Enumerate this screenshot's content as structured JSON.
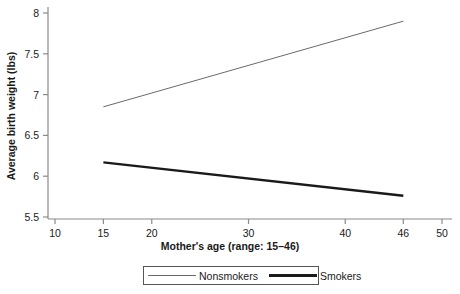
{
  "chart_data": {
    "type": "line",
    "title": "",
    "xlabel": "Mother's age (range: 15–46)",
    "ylabel": "Average birth weight (lbs)",
    "xlim": [
      10,
      50
    ],
    "ylim": [
      5.5,
      8.0
    ],
    "grid": false,
    "legend_position": "bottom",
    "xticks": [
      10,
      15,
      20,
      30,
      40,
      46,
      50
    ],
    "xtick_labels": [
      "10",
      "15",
      "20",
      "30",
      "40",
      "46",
      "50"
    ],
    "yticks": [
      5.5,
      6.0,
      6.5,
      7.0,
      7.5,
      8.0
    ],
    "ytick_labels": [
      "5.5",
      "6",
      "6.5",
      "7",
      "7.5",
      "8"
    ],
    "x": [
      15,
      46
    ],
    "series": [
      {
        "name": "Nonsmokers",
        "values": [
          6.85,
          7.9
        ],
        "color": "#6a6a6a",
        "line_width": 1.0,
        "style": "thin"
      },
      {
        "name": "Smokers",
        "values": [
          6.17,
          5.76
        ],
        "color": "#1a1a1a",
        "line_width": 2.4,
        "style": "thick"
      }
    ],
    "axis_color": "#8a8a8a",
    "text_color": "#1a1a1a",
    "background": "#ffffff"
  }
}
